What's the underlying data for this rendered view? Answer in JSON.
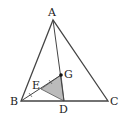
{
  "figure": {
    "points": {
      "A": {
        "label": "A",
        "x": 53,
        "y": 20
      },
      "B": {
        "label": "B",
        "x": 21,
        "y": 101
      },
      "C": {
        "label": "C",
        "x": 108,
        "y": 101
      },
      "D": {
        "label": "D",
        "x": 64,
        "y": 101
      },
      "E": {
        "label": "E",
        "x": 41,
        "y": 89
      },
      "G": {
        "label": "G",
        "x": 61,
        "y": 75
      }
    },
    "shaded_region": "triangle EGD",
    "colors": {
      "stroke": "#444444",
      "shade": "#bbbbbb",
      "point": "#111111"
    }
  }
}
